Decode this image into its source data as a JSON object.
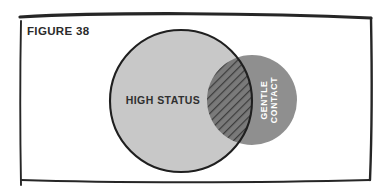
{
  "figure": {
    "title": "FIGURE 38",
    "frame_color": "#262626",
    "background_color": "#ffffff"
  },
  "diagram": {
    "type": "venn",
    "sets": [
      {
        "id": "high-status",
        "label": "HIGH STATUS",
        "fill_color": "#c8c8c8",
        "stroke_color": "#1f1f1f",
        "label_color": "#303030",
        "cx": 181,
        "cy": 101,
        "r": 71
      },
      {
        "id": "gentle-contact",
        "label_line_1": "GENTLE",
        "label_line_2": "CONTACT",
        "fill_color": "#8f8f8f",
        "label_color": "#ffffff",
        "cx": 252,
        "cy": 100,
        "r": 45,
        "label_rotation": -90
      }
    ],
    "intersection": {
      "id": "overlap",
      "fill_color": "#7a7a7a",
      "hatch_color": "#3d3d3d",
      "hatch_angle": 45
    }
  }
}
